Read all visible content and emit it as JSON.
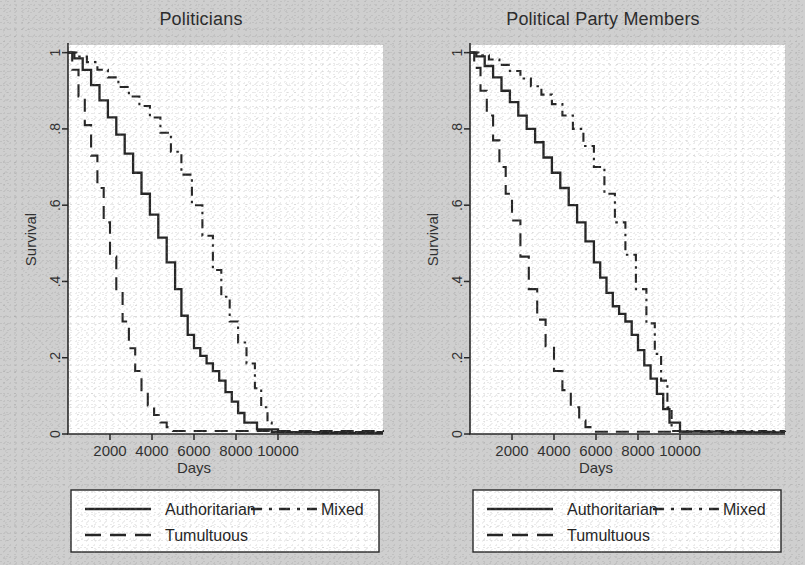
{
  "figure": {
    "background_color": "#cfcfcf",
    "plot_area_color": "#ffffff",
    "ink_color": "#262626"
  },
  "panels": [
    {
      "id": "politicians",
      "title": "Politicians",
      "ylabel": "Survival",
      "xlabel": "Days"
    },
    {
      "id": "political-party-members",
      "title": "Political Party Members",
      "ylabel": "Survival",
      "xlabel": "Days"
    }
  ],
  "legend": {
    "entries": [
      {
        "label": "Authoritarian",
        "style": "solid"
      },
      {
        "label": "Mixed",
        "style": "dash-dot"
      },
      {
        "label": "Tumultuous",
        "style": "long-dash"
      }
    ]
  },
  "axes": {
    "y_ticks": [
      "0",
      ".2",
      ".4",
      ".6",
      ".8",
      "1"
    ],
    "y_values": [
      0,
      0.2,
      0.4,
      0.6,
      0.8,
      1
    ],
    "y_range": [
      0,
      1.02
    ],
    "x_ticks": [
      "2000",
      "4000",
      "6000",
      "8000",
      "10000"
    ],
    "x_values": [
      2000,
      4000,
      6000,
      8000,
      10000
    ],
    "x_range": [
      0,
      15000
    ],
    "grid": false
  },
  "chart_data": {
    "type": "line",
    "subtitle": "Kaplan-Meier survival estimates for Politicians and Political Party Members",
    "xlabel": "Days",
    "ylabel": "Survival",
    "xlim": [
      0,
      15000
    ],
    "ylim": [
      0,
      1.02
    ],
    "x_ticks": [
      2000,
      4000,
      6000,
      8000,
      10000
    ],
    "y_ticks": [
      0,
      0.2,
      0.4,
      0.6,
      0.8,
      1
    ],
    "grid": false,
    "legend_position": "below-axes",
    "panels": [
      {
        "name": "Politicians",
        "series": [
          {
            "name": "Authoritarian",
            "style": "solid",
            "x": [
              0,
              300,
              700,
              1100,
              1500,
              1900,
              2300,
              2700,
              3100,
              3500,
              3900,
              4300,
              4700,
              5100,
              5400,
              5700,
              6000,
              6300,
              6600,
              6900,
              7200,
              7500,
              7800,
              8100,
              8400,
              9000,
              10000,
              12000,
              15000
            ],
            "y": [
              1.0,
              0.985,
              0.955,
              0.915,
              0.875,
              0.83,
              0.785,
              0.735,
              0.685,
              0.63,
              0.575,
              0.515,
              0.45,
              0.38,
              0.31,
              0.26,
              0.225,
              0.205,
              0.185,
              0.165,
              0.14,
              0.11,
              0.085,
              0.055,
              0.03,
              0.012,
              0.005,
              0.003,
              0.003
            ]
          },
          {
            "name": "Mixed",
            "style": "dash-dot",
            "x": [
              0,
              400,
              900,
              1400,
              1900,
              2400,
              2900,
              3400,
              3900,
              4400,
              4900,
              5400,
              5900,
              6400,
              6900,
              7300,
              7700,
              8100,
              8500,
              8900,
              9200,
              9500,
              9700,
              15000
            ],
            "y": [
              1.0,
              0.99,
              0.975,
              0.955,
              0.935,
              0.91,
              0.885,
              0.86,
              0.83,
              0.79,
              0.74,
              0.68,
              0.6,
              0.52,
              0.43,
              0.36,
              0.295,
              0.24,
              0.185,
              0.12,
              0.07,
              0.03,
              0.005,
              0.005
            ]
          },
          {
            "name": "Tumultuous",
            "style": "long-dash",
            "x": [
              0,
              200,
              500,
              800,
              1100,
              1400,
              1700,
              2000,
              2300,
              2600,
              2900,
              3200,
              3500,
              3800,
              4100,
              4400,
              4700,
              5000,
              15000
            ],
            "y": [
              1.0,
              0.955,
              0.885,
              0.81,
              0.73,
              0.645,
              0.555,
              0.465,
              0.375,
              0.295,
              0.225,
              0.165,
              0.115,
              0.075,
              0.05,
              0.03,
              0.018,
              0.008,
              0.005
            ]
          }
        ]
      },
      {
        "name": "Political Party Members",
        "series": [
          {
            "name": "Authoritarian",
            "style": "solid",
            "x": [
              0,
              300,
              700,
              1100,
              1500,
              1900,
              2300,
              2700,
              3100,
              3500,
              3900,
              4300,
              4700,
              5100,
              5500,
              5900,
              6200,
              6500,
              6800,
              7100,
              7400,
              7700,
              8000,
              8300,
              8600,
              8900,
              9200,
              9500,
              10000,
              12000,
              15000
            ],
            "y": [
              1.0,
              0.99,
              0.965,
              0.935,
              0.9,
              0.87,
              0.835,
              0.8,
              0.765,
              0.725,
              0.685,
              0.645,
              0.6,
              0.555,
              0.505,
              0.45,
              0.41,
              0.37,
              0.335,
              0.315,
              0.295,
              0.26,
              0.22,
              0.18,
              0.145,
              0.105,
              0.065,
              0.03,
              0.006,
              0.004,
              0.004
            ]
          },
          {
            "name": "Mixed",
            "style": "dash-dot",
            "x": [
              0,
              400,
              900,
              1400,
              1900,
              2400,
              2900,
              3400,
              3900,
              4400,
              4900,
              5400,
              5900,
              6400,
              6900,
              7400,
              7900,
              8400,
              8800,
              9100,
              9400,
              9600,
              15000
            ],
            "y": [
              1.0,
              0.993,
              0.982,
              0.968,
              0.952,
              0.932,
              0.912,
              0.89,
              0.865,
              0.835,
              0.8,
              0.755,
              0.7,
              0.63,
              0.555,
              0.47,
              0.38,
              0.29,
              0.21,
              0.14,
              0.07,
              0.008,
              0.008
            ]
          },
          {
            "name": "Tumultuous",
            "style": "long-dash",
            "x": [
              0,
              200,
              500,
              800,
              1100,
              1400,
              1700,
              2000,
              2400,
              2800,
              3200,
              3600,
              4000,
              4400,
              4800,
              5200,
              5500,
              5800,
              15000
            ],
            "y": [
              1.0,
              0.96,
              0.9,
              0.835,
              0.77,
              0.7,
              0.63,
              0.56,
              0.465,
              0.38,
              0.3,
              0.23,
              0.165,
              0.115,
              0.07,
              0.035,
              0.018,
              0.006,
              0.005
            ]
          }
        ]
      }
    ]
  }
}
